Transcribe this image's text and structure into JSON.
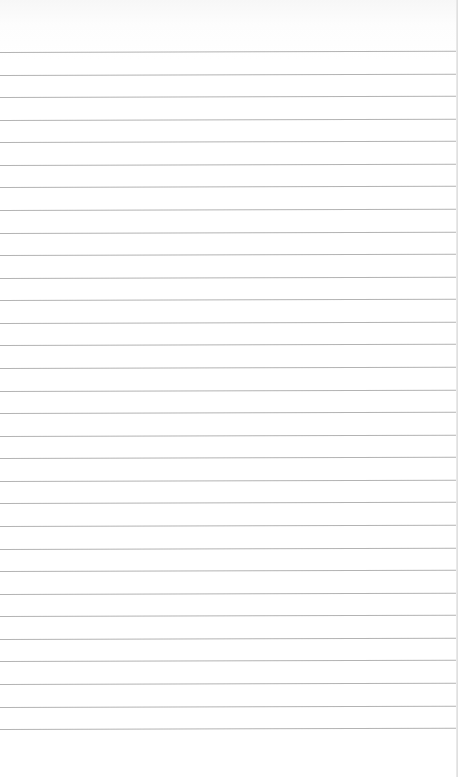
{
  "image": {
    "description": "Blank sheet of ruled notebook paper",
    "background_color": "#ffffff",
    "rule_color": "#9a9a9a",
    "rule_count": 31,
    "first_rule_y": 52,
    "rule_spacing": 22.57
  }
}
